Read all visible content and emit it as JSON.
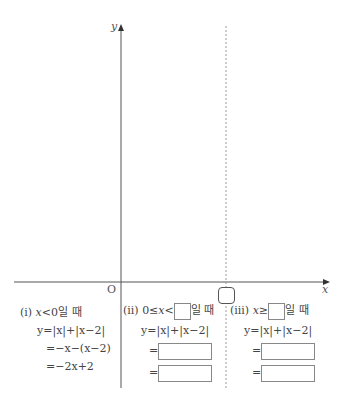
{
  "graph": {
    "y_axis_label": "y",
    "x_axis_label": "x",
    "origin_label": "O",
    "dashed_line_marker": "rounded-blank"
  },
  "cases": [
    {
      "id": "i",
      "header_prefix": "(i) ",
      "condition_var": "x",
      "condition_op": "<",
      "condition_value": "0",
      "header_suffix": "일 때",
      "lines": [
        "y=|x|+|x−2|",
        "=−x−(x−2)",
        "=−2x+2"
      ]
    },
    {
      "id": "ii",
      "header_prefix": "(ii) ",
      "condition_left": "0≤",
      "condition_var": "x",
      "condition_op": "<",
      "condition_blank": true,
      "header_suffix": "일 때",
      "first_line": "y=|x|+|x−2|",
      "eq_sign": "="
    },
    {
      "id": "iii",
      "header_prefix": "(iii) ",
      "condition_var": "x",
      "condition_op": "≥",
      "condition_blank": true,
      "header_suffix": "일 때",
      "first_line": "y=|x|+|x−2|",
      "eq_sign": "="
    }
  ]
}
